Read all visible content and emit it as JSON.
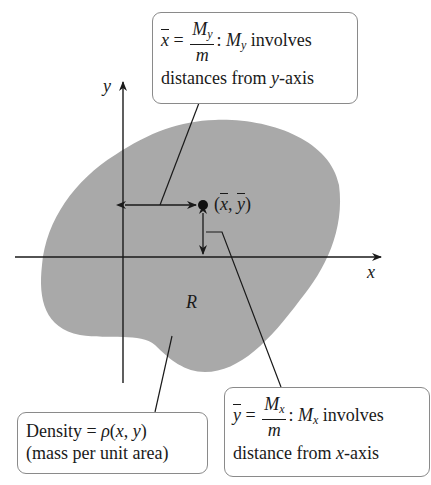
{
  "diagram": {
    "region_label": "R",
    "x_axis_label": "x",
    "y_axis_label": "y",
    "centroid_label": "(x̄, ȳ)",
    "colors": {
      "region_fill": "#a9a9a9",
      "lines": "#1a1a1a",
      "box_border": "#8a8a8a"
    }
  },
  "boxes": {
    "xbar": {
      "lhs": "x",
      "eq": "=",
      "num": "M",
      "num_sub": "y",
      "den": "m",
      "rest_M": "M",
      "rest_sub": "y",
      "rest_text": " involves",
      "line2_a": "distances from ",
      "line2_var": "y",
      "line2_b": "-axis"
    },
    "ybar": {
      "lhs": "y",
      "eq": "=",
      "num": "M",
      "num_sub": "x",
      "den": "m",
      "rest_M": "M",
      "rest_sub": "x",
      "rest_text": " involves",
      "line2_a": "distance from ",
      "line2_var": "x",
      "line2_b": "-axis"
    },
    "density": {
      "line1_a": "Density = ",
      "rho": "ρ",
      "line1_b": "(",
      "var_x": "x",
      "comma": ", ",
      "var_y": "y",
      "close": ")",
      "line2": "(mass per unit area)"
    }
  }
}
